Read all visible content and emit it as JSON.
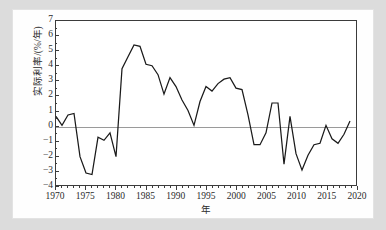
{
  "chart_data": {
    "type": "line",
    "title": "",
    "subtitle": "",
    "xlabel": "年",
    "ylabel": "实际利率/(%/年)",
    "xlim": [
      1970,
      2020
    ],
    "ylim": [
      -4,
      7
    ],
    "y_ticks": [
      7,
      6,
      5,
      4,
      3,
      2,
      1,
      0,
      -1,
      -2,
      -3,
      -4
    ],
    "y_tick_labels": [
      "7",
      "6",
      "5",
      "4",
      "3",
      "2",
      "1",
      "0",
      "−1",
      "−2",
      "−3",
      "−4"
    ],
    "x_ticks": [
      1970,
      1975,
      1980,
      1985,
      1990,
      1995,
      2000,
      2005,
      2010,
      2015,
      2020
    ],
    "x_tick_labels": [
      "1970",
      "1975",
      "1980",
      "1985",
      "1990",
      "1995",
      "2000",
      "2005",
      "2010",
      "2015",
      "2020"
    ],
    "x_minor_step": 1,
    "grid": false,
    "legend": null,
    "legend_position": "none",
    "zero_reference_line": 0,
    "line_color": "#1a1a1a",
    "zero_line_color": "#9a9a9a",
    "axis_color": "#3b3b3b",
    "series": [
      {
        "name": "实际利率",
        "x": [
          1970,
          1971,
          1972,
          1973,
          1974,
          1975,
          1976,
          1977,
          1978,
          1979,
          1980,
          1981,
          1982,
          1983,
          1984,
          1985,
          1986,
          1987,
          1988,
          1989,
          1990,
          1991,
          1992,
          1993,
          1994,
          1995,
          1996,
          1997,
          1998,
          1999,
          2000,
          2001,
          2002,
          2003,
          2004,
          2005,
          2006,
          2007,
          2008,
          2009,
          2010,
          2011,
          2012,
          2013,
          2014,
          2015,
          2016,
          2017,
          2018,
          2019
        ],
        "values": [
          0.6,
          0.0,
          0.7,
          0.8,
          -2.1,
          -3.2,
          -3.3,
          -0.8,
          -1.0,
          -0.5,
          -2.1,
          3.8,
          4.6,
          5.4,
          5.3,
          4.1,
          4.0,
          3.4,
          2.1,
          3.2,
          2.6,
          1.7,
          1.0,
          0.0,
          1.6,
          2.6,
          2.3,
          2.8,
          3.1,
          3.2,
          2.5,
          2.4,
          0.7,
          -1.3,
          -1.3,
          -0.5,
          1.5,
          1.5,
          -2.6,
          0.6,
          -1.9,
          -3.0,
          -2.0,
          -1.3,
          -1.2,
          0.0,
          -0.9,
          -1.2,
          -0.6,
          0.3
        ]
      }
    ]
  },
  "figure": {
    "background_color": "#dcdcdc",
    "card_color": "#fefefe"
  }
}
